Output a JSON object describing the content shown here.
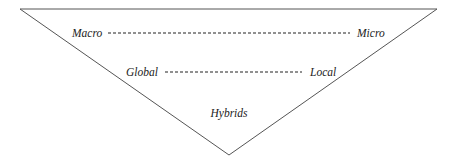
{
  "diagram": {
    "shape": "inverted-triangle",
    "line_color": "#555555",
    "rows": [
      {
        "left": "Macro",
        "right": "Micro"
      },
      {
        "left": "Global",
        "right": "Local"
      }
    ],
    "apex_label": "Hybrids"
  }
}
